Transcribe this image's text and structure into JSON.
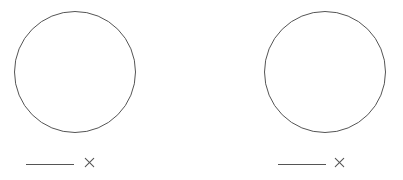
{
  "figure": {
    "background_color": "#ffffff",
    "width": 403,
    "height": 180,
    "panel_count": 2
  },
  "style": {
    "stroke_color": "#555555",
    "stroke_color_light": "#6b6b6b",
    "circle_stroke_width": "1px",
    "bar_stroke_width": "1.5px",
    "x_stroke_width": "1.1px"
  },
  "panels": [
    {
      "id": "left",
      "name": "left-panel",
      "circle": {
        "name": "circle-outline",
        "center_x": 75,
        "center_y": 72,
        "radius": 61,
        "left": 14,
        "top": 11,
        "diameter": 122,
        "filled": false
      },
      "annotation": {
        "name": "scale-annotation",
        "bar": {
          "name": "scale-bar",
          "x_start": 26,
          "x_end": 74,
          "y": 164,
          "length": 48
        },
        "marker": {
          "name": "x-mark",
          "glyph": "×",
          "center_x": 88,
          "center_y": 159,
          "size": 9
        }
      }
    },
    {
      "id": "right",
      "name": "right-panel",
      "circle": {
        "name": "circle-outline",
        "center_x": 325,
        "center_y": 72,
        "radius": 61,
        "left": 264,
        "top": 11,
        "diameter": 122,
        "filled": false
      },
      "annotation": {
        "name": "scale-annotation",
        "bar": {
          "name": "scale-bar",
          "x_start": 278,
          "x_end": 326,
          "y": 164,
          "length": 48
        },
        "marker": {
          "name": "x-mark",
          "glyph": "×",
          "center_x": 338,
          "center_y": 159,
          "size": 9
        }
      }
    }
  ]
}
